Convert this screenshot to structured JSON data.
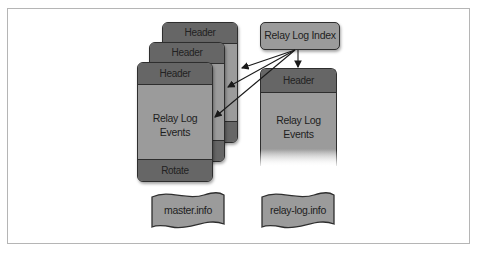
{
  "diagram": {
    "colors": {
      "card_fill": "#9b9b9b",
      "band_fill": "#666666",
      "outline": "#2e2e2e",
      "frame": "#b5b5b5"
    },
    "master_stack": {
      "back_card": {
        "header": "Header"
      },
      "middle_card": {
        "header": "Header"
      },
      "front_card": {
        "header": "Header",
        "body_line1": "Relay Log",
        "body_line2": "Events",
        "footer": "Rotate"
      }
    },
    "index": {
      "label": "Relay Log Index"
    },
    "current_log": {
      "header": "Header",
      "body_line1": "Relay Log",
      "body_line2": "Events"
    },
    "info_files": [
      {
        "label": "master.info"
      },
      {
        "label": "relay-log.info"
      }
    ],
    "arrows": [
      {
        "from": "Relay Log Index",
        "to": "back_card"
      },
      {
        "from": "Relay Log Index",
        "to": "middle_card"
      },
      {
        "from": "Relay Log Index",
        "to": "front_card"
      },
      {
        "from": "Relay Log Index",
        "to": "current_log"
      }
    ]
  }
}
